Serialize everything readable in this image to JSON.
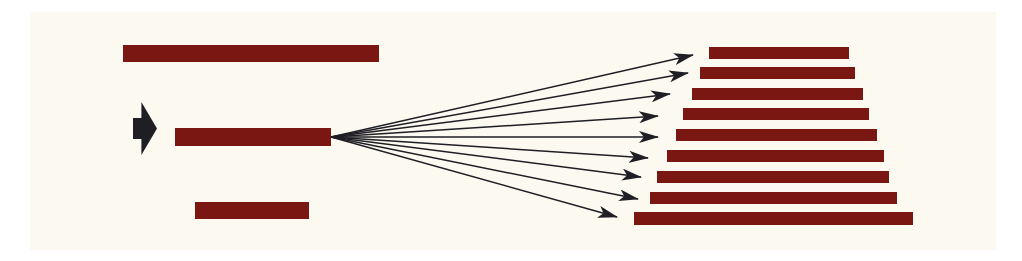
{
  "colors": {
    "background": "#ffffff",
    "panel": "#fcf9f0",
    "bar": "#7b1712",
    "arrow": "#1e1e24"
  },
  "diagram": {
    "source_bars": [
      {
        "x": 123,
        "y": 45,
        "w": 256,
        "h": 17
      },
      {
        "x": 175,
        "y": 128,
        "w": 156,
        "h": 18,
        "selected": true
      },
      {
        "x": 195,
        "y": 202,
        "w": 114,
        "h": 17
      }
    ],
    "pointer": {
      "x": 133,
      "y": 102,
      "w": 24,
      "h": 53,
      "icon": "pointer-arrow-icon"
    },
    "fan_origin": {
      "x": 331,
      "y": 137
    },
    "target_bars": [
      {
        "x": 709,
        "y": 47,
        "w": 140,
        "h": 12,
        "tip": [
          693,
          55
        ]
      },
      {
        "x": 700,
        "y": 67,
        "w": 155,
        "h": 12,
        "tip": [
          688,
          73
        ]
      },
      {
        "x": 692,
        "y": 88,
        "w": 171,
        "h": 12,
        "tip": [
          670,
          94
        ]
      },
      {
        "x": 683,
        "y": 108,
        "w": 186,
        "h": 12,
        "tip": [
          658,
          116
        ]
      },
      {
        "x": 676,
        "y": 129,
        "w": 201,
        "h": 12,
        "tip": [
          658,
          137
        ]
      },
      {
        "x": 667,
        "y": 150,
        "w": 217,
        "h": 12,
        "tip": [
          648,
          158
        ]
      },
      {
        "x": 657,
        "y": 171,
        "w": 232,
        "h": 12,
        "tip": [
          641,
          177
        ]
      },
      {
        "x": 650,
        "y": 192,
        "w": 247,
        "h": 12,
        "tip": [
          638,
          199
        ]
      },
      {
        "x": 634,
        "y": 212,
        "w": 279,
        "h": 13,
        "tip": [
          617,
          217
        ]
      }
    ]
  }
}
